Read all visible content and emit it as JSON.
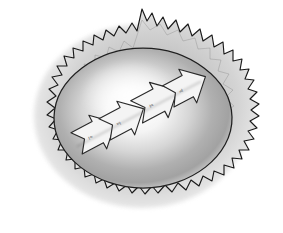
{
  "illustration": {
    "title": "Hand-drawn burst with inner oval and four chevron arrows",
    "background_color": "#ffffff",
    "canvas": {
      "width": 283,
      "height": 233
    },
    "burst": {
      "name": "spiky-burst-shape",
      "outline_color": "#1a1a1a",
      "fill_gradient_outer": "#d8d8d8",
      "fill_gradient_inner": "#bdbdbd",
      "stroke_width": 1.1,
      "spike_count": 46
    },
    "inner_oval": {
      "name": "inner-oval-nucleus",
      "outline_color": "#1f1f1f",
      "ring_color": "#a8a8a8",
      "center_color": "#fbfbfb",
      "cx": 143,
      "cy": 118,
      "rx": 88,
      "ry": 70
    },
    "arrows": [
      {
        "label": "arrow-1",
        "mark": "≀≈",
        "cx": 96,
        "cy": 133,
        "rotation": -28,
        "scale": 1.0,
        "fill": "#f4f4f4",
        "stroke": "#2a2a2a"
      },
      {
        "label": "arrow-2",
        "mark": "≈≀",
        "cx": 122,
        "cy": 119,
        "rotation": -28,
        "scale": 1.0,
        "fill": "#f4f4f4",
        "stroke": "#2a2a2a"
      },
      {
        "label": "arrow-3",
        "mark": "≀≈",
        "cx": 157,
        "cy": 101,
        "rotation": -28,
        "scale": 1.05,
        "fill": "#f4f4f4",
        "stroke": "#2a2a2a"
      },
      {
        "label": "arrow-4",
        "mark": "≈≀",
        "cx": 184,
        "cy": 88,
        "rotation": -28,
        "scale": 1.0,
        "fill": "#f4f4f4",
        "stroke": "#2a2a2a"
      }
    ]
  }
}
